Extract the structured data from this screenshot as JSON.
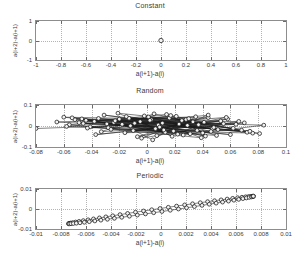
{
  "figure": {
    "width": 300,
    "height": 258,
    "background": "#ffffff",
    "axis_color": "#8d8d8d",
    "grid_color": "#b4b4b4",
    "marker_edge_color": "#1a1a1a",
    "marker_face_color": "#f2f2f2",
    "line_color": "#1a1a1a"
  },
  "panels": [
    {
      "id": "constant",
      "title": "Constant",
      "xlabel": "a(i+1)-a(i)",
      "ylabel": "a(i+2)-a(i+1)",
      "xticks": [
        "-1",
        "-0.8",
        "-0.6",
        "-0.4",
        "-0.2",
        "0",
        "0.2",
        "0.4",
        "0.6",
        "0.8",
        "1"
      ],
      "yticks": [
        "1",
        "0",
        "-1"
      ]
    },
    {
      "id": "random",
      "title": "Random",
      "xlabel": "a(i+1)-a(i)",
      "ylabel": "a(i+2)-a(i+1)",
      "xticks": [
        "-0.08",
        "-0.06",
        "-0.04",
        "-0.02",
        "0",
        "0.02",
        "0.04",
        "0.06",
        "0.08",
        "0.1"
      ],
      "yticks": [
        "0.1",
        "0",
        "-0.1"
      ]
    },
    {
      "id": "periodic",
      "title": "Periodic",
      "xlabel": "a(i+1)-a(i)",
      "ylabel": "a(i+2)-a(i+1)",
      "xticks": [
        "-0.01",
        "-0.008",
        "-0.006",
        "-0.004",
        "-0.002",
        "0",
        "0.002",
        "0.004",
        "0.006",
        "0.008",
        "0.01"
      ],
      "yticks": [
        "0.01",
        "0",
        "-0.01"
      ]
    }
  ],
  "chart_data": [
    {
      "type": "scatter",
      "title": "Constant",
      "xlabel": "a(i+1)-a(i)",
      "ylabel": "a(i+2)-a(i+1)",
      "xlim": [
        -1,
        1
      ],
      "ylim": [
        -1,
        1
      ],
      "xticks": [
        -1,
        -0.8,
        -0.6,
        -0.4,
        -0.2,
        0,
        0.2,
        0.4,
        0.6,
        0.8,
        1
      ],
      "yticks": [
        -1,
        0,
        1
      ],
      "grid": true,
      "legend": "none",
      "marker": "circle",
      "points": [
        [
          0,
          0
        ]
      ]
    },
    {
      "type": "line",
      "title": "Random",
      "xlabel": "a(i+1)-a(i)",
      "ylabel": "a(i+2)-a(i+1)",
      "xlim": [
        -0.08,
        0.1
      ],
      "ylim": [
        -0.1,
        0.1
      ],
      "xticks": [
        -0.08,
        -0.06,
        -0.04,
        -0.02,
        0,
        0.02,
        0.04,
        0.06,
        0.08,
        0.1
      ],
      "yticks": [
        -0.1,
        0,
        0.1
      ],
      "grid": true,
      "legend": "none",
      "marker": "circle",
      "points": [
        [
          -0.08,
          -0.012
        ],
        [
          0.041,
          0.018
        ],
        [
          -0.021,
          0.061
        ],
        [
          0.013,
          -0.03
        ],
        [
          -0.038,
          0.022
        ],
        [
          0.06,
          -0.041
        ],
        [
          -0.06,
          0.042
        ],
        [
          0.028,
          0.031
        ],
        [
          0.004,
          -0.066
        ],
        [
          -0.018,
          0.008
        ],
        [
          0.047,
          -0.013
        ],
        [
          -0.046,
          0.012
        ],
        [
          0.021,
          0.046
        ],
        [
          0.036,
          -0.021
        ],
        [
          -0.028,
          -0.008
        ],
        [
          0.055,
          0.011
        ],
        [
          -0.013,
          0.037
        ],
        [
          0.018,
          -0.049
        ],
        [
          -0.005,
          0.021
        ],
        [
          0.072,
          -0.03
        ],
        [
          -0.035,
          0.036
        ],
        [
          0.008,
          0.005
        ],
        [
          0.044,
          0.04
        ],
        [
          -0.052,
          0.03
        ],
        [
          0.031,
          -0.037
        ],
        [
          -0.01,
          -0.022
        ],
        [
          0.064,
          0.008
        ],
        [
          -0.024,
          0.017
        ],
        [
          0.001,
          0.043
        ],
        [
          0.05,
          -0.045
        ],
        [
          -0.041,
          -0.004
        ],
        [
          0.025,
          0.026
        ],
        [
          0.081,
          -0.036
        ],
        [
          -0.031,
          0.052
        ],
        [
          0.011,
          0.014
        ],
        [
          0.039,
          -0.056
        ],
        [
          -0.056,
          0.006
        ],
        [
          0.016,
          0.038
        ],
        [
          0.068,
          -0.02
        ],
        [
          -0.016,
          -0.032
        ],
        [
          0.033,
          0.02
        ],
        [
          -0.044,
          0.027
        ],
        [
          0.006,
          -0.013
        ],
        [
          0.058,
          0.033
        ],
        [
          -0.007,
          -0.051
        ],
        [
          0.023,
          0.009
        ],
        [
          0.046,
          -0.026
        ],
        [
          -0.049,
          0.016
        ],
        [
          0.014,
          0.055
        ],
        [
          0.076,
          -0.034
        ],
        [
          -0.026,
          -0.016
        ],
        [
          0.003,
          0.03
        ],
        [
          0.053,
          0.024
        ],
        [
          -0.037,
          -0.041
        ],
        [
          0.029,
          0.003
        ],
        [
          -0.002,
          0.048
        ],
        [
          0.062,
          -0.011
        ],
        [
          -0.02,
          0.033
        ],
        [
          0.042,
          -0.048
        ],
        [
          0.009,
          -0.005
        ],
        [
          -0.065,
          0.019
        ],
        [
          0.035,
          0.044
        ],
        [
          0.019,
          -0.024
        ],
        [
          -0.012,
          0.001
        ],
        [
          0.07,
          0.015
        ],
        [
          -0.033,
          -0.027
        ],
        [
          0.005,
          0.058
        ],
        [
          0.048,
          -0.007
        ],
        [
          -0.054,
          0.039
        ],
        [
          0.026,
          -0.043
        ],
        [
          0.084,
          0.004
        ],
        [
          -0.023,
          0.025
        ],
        [
          0.012,
          -0.019
        ],
        [
          0.057,
          0.041
        ],
        [
          -0.043,
          -0.01
        ],
        [
          0.03,
          0.035
        ],
        [
          -0.004,
          -0.058
        ],
        [
          0.066,
          0.022
        ],
        [
          -0.029,
          0.01
        ],
        [
          0.017,
          0.05
        ],
        [
          0.04,
          -0.033
        ],
        [
          -0.058,
          -0.002
        ],
        [
          0.002,
          0.027
        ],
        [
          0.051,
          -0.017
        ],
        [
          -0.015,
          0.045
        ],
        [
          0.037,
          0.006
        ],
        [
          0.022,
          -0.039
        ],
        [
          -0.047,
          0.034
        ],
        [
          0.074,
          -0.025
        ],
        [
          -0.009,
          0.013
        ],
        [
          0.044,
          0.052
        ],
        [
          0.007,
          -0.046
        ]
      ]
    },
    {
      "type": "line",
      "title": "Periodic",
      "xlabel": "a(i+1)-a(i)",
      "ylabel": "a(i+2)-a(i+1)",
      "xlim": [
        -0.01,
        0.01
      ],
      "ylim": [
        -0.01,
        0.01
      ],
      "xticks": [
        -0.01,
        -0.008,
        -0.006,
        -0.004,
        -0.002,
        0,
        0.002,
        0.004,
        0.006,
        0.008,
        0.01
      ],
      "yticks": [
        -0.01,
        0,
        0.01
      ],
      "grid": true,
      "legend": "none",
      "marker": "circle",
      "description": "Narrow closed loop: points lie on a thin elongated ellipse from (-0.01,-0.01) to (0.01,0.009)",
      "ellipse": {
        "n_points": 70,
        "center": [
          0.0,
          -0.0005
        ],
        "semi_major": 0.0101,
        "semi_minor": 0.0006,
        "angle_deg": 43
      }
    }
  ]
}
